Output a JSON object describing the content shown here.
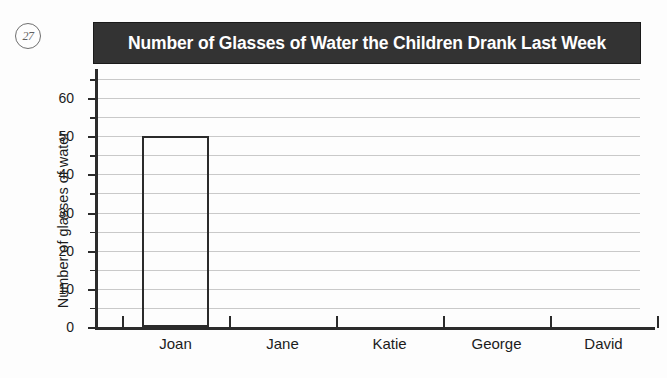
{
  "question_marker": "27",
  "chart_data": {
    "type": "bar",
    "title": "Number of Glasses of Water the Children Drank Last Week",
    "categories": [
      "Joan",
      "Jane",
      "Katie",
      "George",
      "David"
    ],
    "values": [
      50,
      0,
      0,
      0,
      0
    ],
    "xlabel": "",
    "ylabel": "Number of glasses of water",
    "ylim": [
      0,
      65
    ],
    "ytick_labels": [
      "0",
      "10",
      "20",
      "30",
      "40",
      "50",
      "60"
    ],
    "ytick_values": [
      0,
      10,
      20,
      30,
      40,
      50,
      60
    ],
    "yminor_step": 5,
    "gridline_values": [
      5,
      10,
      15,
      20,
      25,
      30,
      35,
      40,
      45,
      50,
      55,
      60,
      65
    ],
    "grid": true,
    "legend": "none",
    "bar_fill": "#ffffff",
    "bar_outline": "#2b2b2b",
    "title_background": "#333333",
    "title_color": "#ffffff",
    "gridline_color": "#c9c9c9",
    "axis_color": "#2b2b2b"
  }
}
